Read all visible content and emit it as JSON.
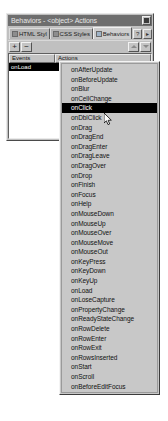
{
  "window": {
    "title": "Behaviors - <object> Actions",
    "close_icon": "close-icon"
  },
  "tabs": [
    {
      "label": "HTML Styl",
      "icon": "html-styles-icon",
      "active": false
    },
    {
      "label": "CSS Styles",
      "icon": "css-styles-icon",
      "active": false
    },
    {
      "label": "Behaviors",
      "icon": "behaviors-icon",
      "active": true
    }
  ],
  "tab_buttons": [
    {
      "label": "?",
      "name": "help-button"
    },
    {
      "label": "▸",
      "name": "panel-options-button"
    }
  ],
  "toolbar": {
    "add_label": "+",
    "remove_label": "−",
    "move_up_icon": "triangle-up-icon",
    "move_down_icon": "triangle-down-icon"
  },
  "list": {
    "columns": [
      "Events",
      "Actions"
    ],
    "rows": [
      {
        "event": "onLoad",
        "action": "",
        "selected": true
      }
    ]
  },
  "dropdown": {
    "selected": "onClick",
    "items": [
      "onAfterUpdate",
      "onBeforeUpdate",
      "onBlur",
      "onCellChange",
      "onClick",
      "onDblClick",
      "onDrag",
      "onDragEnd",
      "onDragEnter",
      "onDragLeave",
      "onDragOver",
      "onDrop",
      "onFinish",
      "onFocus",
      "onHelp",
      "onMouseDown",
      "onMouseUp",
      "onMouseOver",
      "onMouseMove",
      "onMouseOut",
      "onKeyPress",
      "onKeyDown",
      "onKeyUp",
      "onLoad",
      "onLoseCapture",
      "onPropertyChange",
      "onReadyStateChange",
      "onRowDelete",
      "onRowEnter",
      "onRowExit",
      "onRowsInserted",
      "onStart",
      "onScroll",
      "onBeforeEditFocus"
    ]
  },
  "colors": {
    "panel_face": "#c0c0c0",
    "titlebar": "#6e6e6e",
    "selection": "#000000",
    "menu_face": "#c8c8c8"
  }
}
